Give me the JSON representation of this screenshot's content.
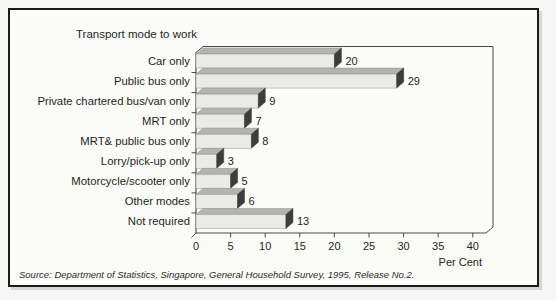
{
  "frame": {
    "source_note": "Source: Department of Statistics, Singapore, General Household Survey, 1995, Release No.2."
  },
  "chart_data": {
    "type": "bar",
    "orientation": "horizontal",
    "style": "3d-pseudo",
    "title": "Transport mode to work",
    "categories": [
      "Car only",
      "Public bus only",
      "Private chartered bus/van only",
      "MRT only",
      "MRT& public bus only",
      "Lorry/pick-up only",
      "Motorcycle/scooter only",
      "Other modes",
      "Not required"
    ],
    "values": [
      20,
      29,
      9,
      7,
      8,
      3,
      5,
      6,
      13
    ],
    "value_labels_shown": true,
    "xlabel": "Per Cent",
    "xlim": [
      0,
      40
    ],
    "xticks": [
      0,
      5,
      10,
      15,
      20,
      25,
      30,
      35,
      40
    ],
    "grid": false,
    "legend": "none",
    "colors": {
      "bar_front": "#eaeae8",
      "bar_top": "#b3b3b1",
      "bar_cap": "#3d3d3b",
      "bar_edge": "#8f8f8c",
      "axis_line": "#4a4a48",
      "text": "#1f1f1f",
      "frame_border": "#1b1b1b"
    }
  }
}
